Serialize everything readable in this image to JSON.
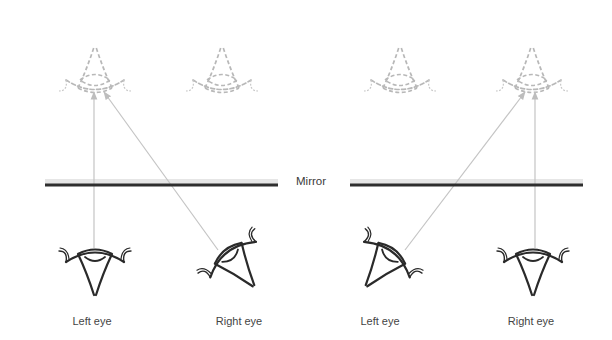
{
  "diagram": {
    "mirror_label": "Mirror",
    "colors": {
      "eye_stroke": "#2a2a2a",
      "reflection_stroke": "#b8b8b8",
      "ray": "#c4c4c4",
      "mirror_line": "#2e2e2e",
      "mirror_glass": "#e6e6e6",
      "text": "#444444"
    },
    "panels": [
      {
        "name": "left-panel",
        "eyes": [
          {
            "label": "Left eye",
            "orientation": "upright"
          },
          {
            "label": "Right eye",
            "orientation": "turned-left"
          }
        ],
        "reflections": 2,
        "rays": [
          {
            "from": "Left eye",
            "to": "reflection-1",
            "direction": "vertical"
          },
          {
            "from": "Right eye",
            "to": "reflection-1",
            "direction": "diagonal"
          }
        ]
      },
      {
        "name": "right-panel",
        "eyes": [
          {
            "label": "Left eye",
            "orientation": "turned-right"
          },
          {
            "label": "Right eye",
            "orientation": "upright"
          }
        ],
        "reflections": 2,
        "rays": [
          {
            "from": "Left eye",
            "to": "reflection-2",
            "direction": "diagonal"
          },
          {
            "from": "Right eye",
            "to": "reflection-2",
            "direction": "vertical"
          }
        ]
      }
    ]
  }
}
